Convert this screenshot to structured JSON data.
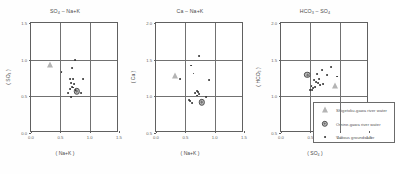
{
  "figure": {
    "background": "#ffffff",
    "marker_colors": {
      "dot": "#2e2e2e",
      "circle_fill": "#b9b9b9",
      "triangle_fill": "#b4b4b4",
      "frame": "#606060",
      "grid": "#717171"
    }
  },
  "chart_data": [
    {
      "type": "scatter",
      "title": "SO₄ – Na+K",
      "title_parts": {
        "y_species": "SO",
        "y_sub": "4",
        "sep": " – ",
        "x_species": "Na+K"
      },
      "xlabel": "( Na+K )",
      "ylabel": "( SO₄ )",
      "xlim": [
        0.0,
        1.5
      ],
      "ylim": [
        0.0,
        1.5
      ],
      "xticks": [
        "0.0",
        "0.5",
        "1.0",
        "1.5"
      ],
      "xtick_values": [
        0.0,
        0.5,
        1.0,
        1.5
      ],
      "yticks": [
        "0.0",
        "0.5",
        "1.0",
        "1.5"
      ],
      "ytick_values": [
        0.0,
        0.5,
        1.0,
        1.5
      ],
      "grid": true,
      "grid_x": [
        0.5,
        1.0
      ],
      "grid_y": [
        0.5,
        1.0
      ],
      "series": [
        {
          "name": "Shigetoku-gawa river water",
          "marker": "triangle",
          "points": [
            [
              0.32,
              0.93
            ]
          ]
        },
        {
          "name": "Omine-gawa river water",
          "marker": "circle",
          "points": [
            [
              0.78,
              0.57
            ]
          ]
        },
        {
          "name": "Various groundwater",
          "marker": "dot",
          "points": [
            [
              0.75,
              1.0
            ],
            [
              0.7,
              0.88
            ],
            [
              0.52,
              0.83
            ],
            [
              0.66,
              0.74
            ],
            [
              0.72,
              0.74
            ],
            [
              0.88,
              0.73
            ],
            [
              0.69,
              0.68
            ],
            [
              0.73,
              0.67
            ],
            [
              0.7,
              0.63
            ],
            [
              0.72,
              0.62
            ],
            [
              0.67,
              0.6
            ],
            [
              0.63,
              0.55
            ],
            [
              0.85,
              0.55
            ],
            [
              0.68,
              0.49
            ],
            [
              0.76,
              0.58
            ]
          ]
        }
      ]
    },
    {
      "type": "scatter",
      "title": "Ca – Na+K",
      "title_parts": {
        "y_species": "Ca",
        "y_sub": "",
        "sep": " – ",
        "x_species": "Na+K"
      },
      "xlabel": "( Na+K )",
      "ylabel": "( Ca )",
      "xlim": [
        0.0,
        1.5
      ],
      "ylim": [
        0.5,
        2.0
      ],
      "xticks": [
        "0.0",
        "0.5",
        "1.0",
        "1.5"
      ],
      "xtick_values": [
        0.0,
        0.5,
        1.0,
        1.5
      ],
      "yticks": [
        "0.5",
        "1.0",
        "1.5",
        "2.0"
      ],
      "ytick_values": [
        0.5,
        1.0,
        1.5,
        2.0
      ],
      "grid": true,
      "grid_x": [
        0.5,
        1.0
      ],
      "grid_y": [
        1.0,
        1.5
      ],
      "series": [
        {
          "name": "Shigetoku-gawa river water",
          "marker": "triangle",
          "points": [
            [
              0.33,
              1.28
            ]
          ]
        },
        {
          "name": "Omine-gawa river water",
          "marker": "circle",
          "points": [
            [
              0.78,
              0.92
            ]
          ]
        },
        {
          "name": "Various groundwater",
          "marker": "dot",
          "points": [
            [
              0.74,
              1.55
            ],
            [
              0.6,
              1.42
            ],
            [
              0.64,
              1.31
            ],
            [
              0.41,
              1.23
            ],
            [
              0.91,
              1.22
            ],
            [
              0.7,
              1.07
            ],
            [
              0.72,
              1.06
            ],
            [
              0.67,
              1.04
            ],
            [
              0.74,
              1.03
            ],
            [
              0.7,
              1.01
            ],
            [
              0.86,
              0.99
            ],
            [
              0.58,
              0.93
            ],
            [
              0.61,
              0.91
            ],
            [
              0.56,
              0.95
            ]
          ]
        }
      ]
    },
    {
      "type": "scatter",
      "title": "HCO₃ – SO₄",
      "title_parts": {
        "y_species": "HCO",
        "y_sub": "3",
        "sep": " – ",
        "x_species": "SO",
        "x_sub": "4"
      },
      "xlabel": "( SO₄ )",
      "ylabel": "( HCO₃ )",
      "xlim": [
        0.0,
        1.5
      ],
      "ylim": [
        0.5,
        2.0
      ],
      "xticks": [
        "0.0",
        "0.5",
        "1.0",
        "1.5"
      ],
      "xtick_values": [
        0.0,
        0.5,
        1.0,
        1.5
      ],
      "yticks": [
        "0.5",
        "1.0",
        "1.5",
        "2.0"
      ],
      "ytick_values": [
        0.5,
        1.0,
        1.5,
        2.0
      ],
      "grid": true,
      "grid_x": [
        0.5,
        1.0
      ],
      "grid_y": [
        1.0,
        1.5
      ],
      "series": [
        {
          "name": "Shigetoku-gawa river water",
          "marker": "triangle",
          "points": [
            [
              0.92,
              1.14
            ]
          ]
        },
        {
          "name": "Omine-gawa river water",
          "marker": "circle",
          "points": [
            [
              0.45,
              1.29
            ]
          ]
        },
        {
          "name": "Various groundwater",
          "marker": "dot",
          "points": [
            [
              0.86,
              1.4
            ],
            [
              0.7,
              1.36
            ],
            [
              0.62,
              1.3
            ],
            [
              0.78,
              1.29
            ],
            [
              0.95,
              1.27
            ],
            [
              0.65,
              1.23
            ],
            [
              0.56,
              1.22
            ],
            [
              0.6,
              1.2
            ],
            [
              0.63,
              1.18
            ],
            [
              0.72,
              1.17
            ],
            [
              0.67,
              1.15
            ],
            [
              0.52,
              1.14
            ],
            [
              0.55,
              1.11
            ],
            [
              0.5,
              1.09
            ],
            [
              0.53,
              1.09
            ],
            [
              0.58,
              1.13
            ]
          ]
        }
      ]
    }
  ],
  "legend": {
    "position": "lower-right-panel-3",
    "entries": [
      {
        "marker": "triangle",
        "label": "Shigetoku-gawa river water"
      },
      {
        "marker": "circle",
        "label": "Omine-gawa river water"
      },
      {
        "marker": "dot",
        "label": "Various groundwater"
      }
    ]
  }
}
